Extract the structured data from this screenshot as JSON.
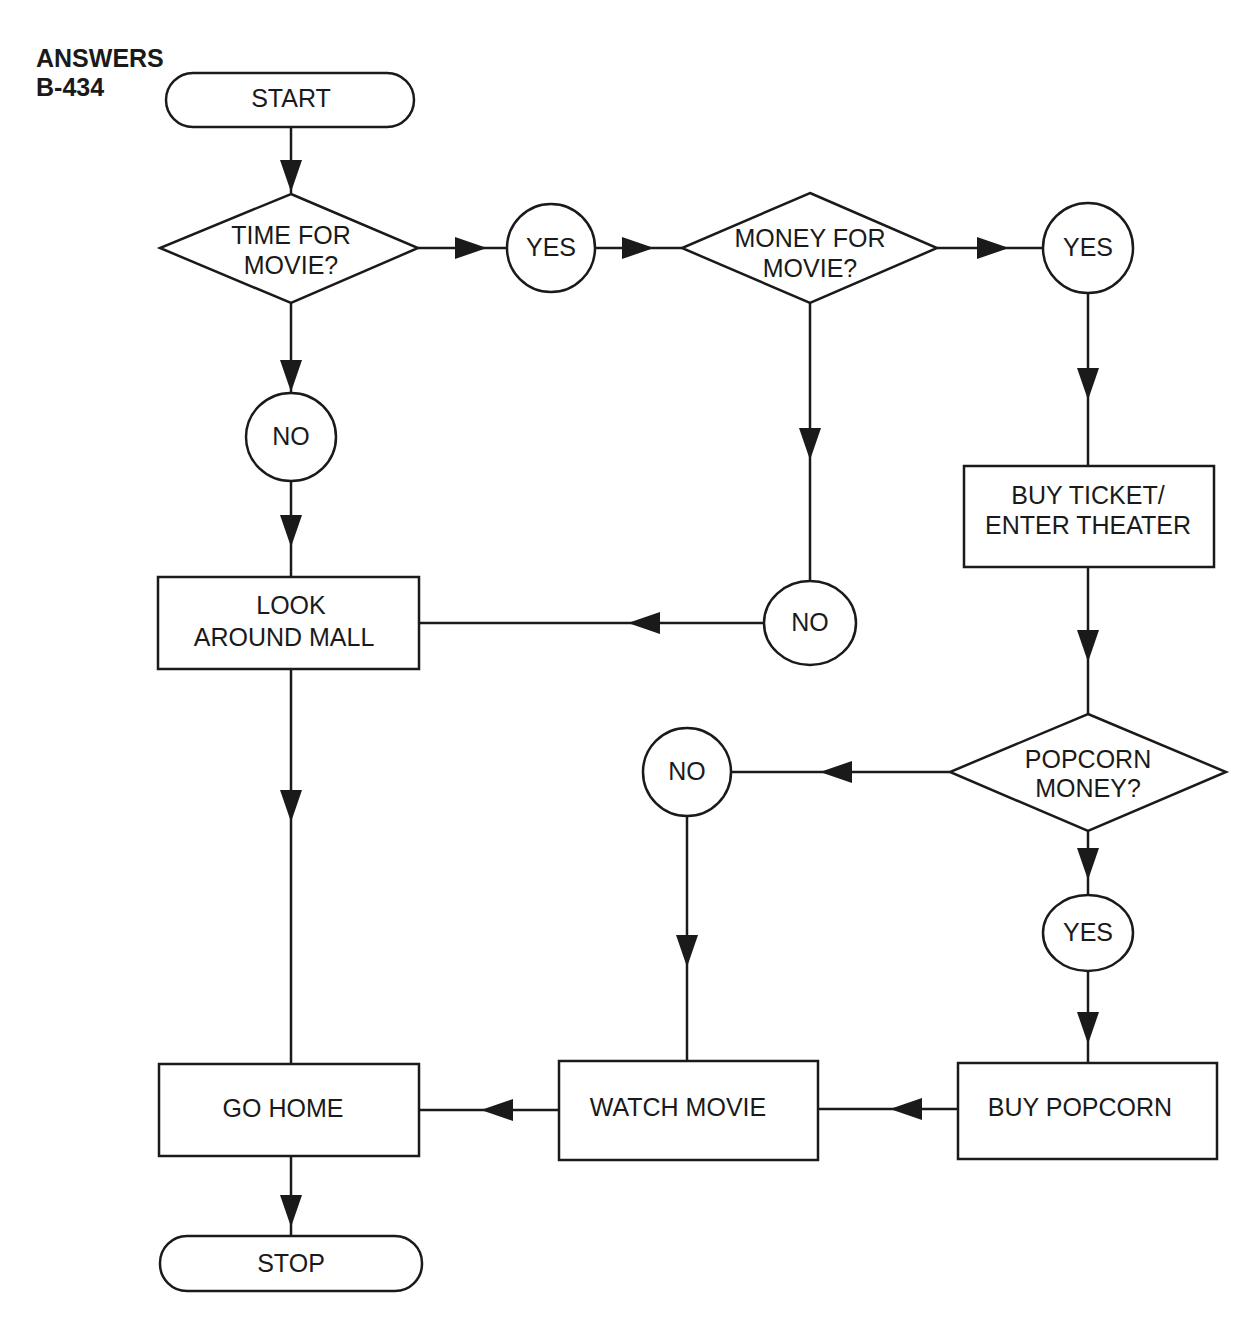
{
  "heading": {
    "line1": "ANSWERS",
    "line2": "B-434"
  },
  "colors": {
    "ink": "#1a1a1a",
    "background": "#ffffff"
  },
  "nodes": {
    "start": "START",
    "time_decision": {
      "line1": "TIME FOR",
      "line2": "MOVIE?"
    },
    "yes_time": "YES",
    "money_decision": {
      "line1": "MONEY FOR",
      "line2": "MOVIE?"
    },
    "yes_money": "YES",
    "no_time": "NO",
    "no_money": "NO",
    "buy_ticket": {
      "line1": "BUY  TICKET/",
      "line2": "ENTER THEATER"
    },
    "look_around": {
      "line1": "LOOK",
      "line2": "AROUND MALL"
    },
    "popcorn_decision": {
      "line1": "POPCORN",
      "line2": "MONEY?"
    },
    "no_popcorn": "NO",
    "yes_popcorn": "YES",
    "go_home": "GO HOME",
    "watch_movie": "WATCH MOVIE",
    "buy_popcorn": "BUY POPCORN",
    "stop": "STOP"
  }
}
